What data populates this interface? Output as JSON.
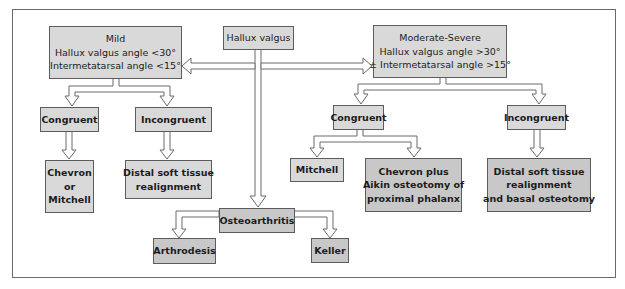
{
  "diagram": {
    "root": {
      "label": "Hallux valgus"
    },
    "mild": {
      "title": "Mild",
      "lines": [
        "Hallux valgus angle <30°",
        "Intermetatarsal angle <15°"
      ]
    },
    "moderate_severe": {
      "title": "Moderate-Severe",
      "lines": [
        "Hallux valgus angle >30°",
        "± Intermetatarsal angle >15°"
      ]
    },
    "mild_branches": {
      "congruent": {
        "label": "Congruent"
      },
      "incongruent": {
        "label": "Incongruent"
      },
      "congruent_treatment": {
        "lines": [
          "Chevron",
          "or",
          "Mitchell"
        ]
      },
      "incongruent_treatment": {
        "lines": [
          "Distal soft tissue",
          "realignment"
        ]
      }
    },
    "severe_branches": {
      "congruent": {
        "label": "Congruent"
      },
      "incongruent": {
        "label": "Incongruent"
      },
      "congruent_treatment_a": {
        "label": "Mitchell"
      },
      "congruent_treatment_b": {
        "lines": [
          "Chevron plus",
          "Aikin osteotomy of",
          "proximal phalanx"
        ]
      },
      "incongruent_treatment": {
        "lines": [
          "Distal soft tissue",
          "realignment",
          "and basal osteotomy"
        ]
      }
    },
    "osteoarthritis": {
      "label": "Osteoarthritis",
      "treatments": [
        "Arthrodesis",
        "Keller"
      ]
    }
  },
  "colors": {
    "box_fill": "#d9d9d9",
    "box_fill_dark": "#c8c8c8",
    "border": "#5c5c5c",
    "arrow_fill": "#ffffff",
    "arrow_stroke": "#6a6a6a"
  }
}
